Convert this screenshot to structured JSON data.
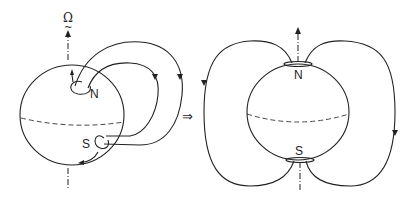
{
  "diagram": {
    "colors": {
      "stroke": "#222222",
      "background": "#ffffff"
    },
    "left_panel": {
      "rotation_symbol": "Ω",
      "rotation_tilde": "~",
      "north_label": "N",
      "south_label": "S"
    },
    "transition_arrow": "⇒",
    "right_panel": {
      "north_label": "N",
      "south_label": "S"
    }
  }
}
